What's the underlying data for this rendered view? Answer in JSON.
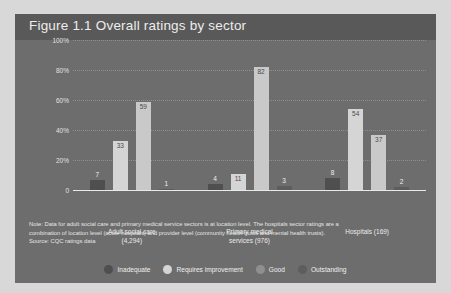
{
  "figure": {
    "title": "Figure 1.1  Overall ratings by sector",
    "note_line_1": "Note: Data for adult social care and primary medical service sectors is at location level. The hospitals sector ratings are a",
    "note_line_2": "combination of location level (acute hospitals) and provider level (community health trusts and mental health trusts).",
    "source": "Source: CQC ratings data"
  },
  "colors": {
    "panel_background": "#6d6d6d",
    "title_background": "#595959",
    "inadequate": "#4f4f4f",
    "requires_improvement": "#d5d5d5",
    "good": "#bfbfbf",
    "outstanding": "#6a6a6a",
    "axis": "#e9e9e9",
    "grid": "#9a9a9a",
    "text": "#ececec"
  },
  "legend": {
    "items": [
      {
        "label": "Inadequate",
        "color": "#4f4f4f"
      },
      {
        "label": "Requires improvement",
        "color": "#d5d5d5"
      },
      {
        "label": "Good",
        "color": "#8f8f8f"
      },
      {
        "label": "Outstanding",
        "color": "#5d5d5d"
      }
    ]
  },
  "chart_data": {
    "type": "bar",
    "title": "Figure 1.1  Overall ratings by sector",
    "xlabel": "",
    "ylabel": "",
    "ylim": [
      0,
      100
    ],
    "yticks": [
      "0",
      "20%",
      "40%",
      "60%",
      "80%",
      "100%"
    ],
    "ytick_values": [
      0,
      20,
      40,
      60,
      80,
      100
    ],
    "grid": true,
    "legend_position": "bottom",
    "categories": [
      "Adult social care (4,294)",
      "Primary medical services (976)",
      "Hospitals (169)"
    ],
    "category_lines": [
      [
        "Adult social care",
        "(4,294)"
      ],
      [
        "Primary medical",
        "services (976)"
      ],
      [
        "Hospitals (169)",
        ""
      ]
    ],
    "series": [
      {
        "name": "Inadequate",
        "color": "#4f4f4f",
        "values": [
          7,
          4,
          8
        ]
      },
      {
        "name": "Requires improvement",
        "color": "#d5d5d5",
        "values": [
          33,
          11,
          54
        ]
      },
      {
        "name": "Good",
        "color": "#c9c9c9",
        "values": [
          59,
          82,
          37
        ]
      },
      {
        "name": "Outstanding",
        "color": "#5d5d5d",
        "values": [
          1,
          3,
          2
        ]
      }
    ]
  }
}
